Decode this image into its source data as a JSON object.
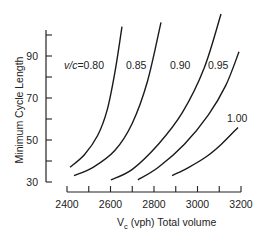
{
  "chart_data": {
    "type": "line",
    "title": "",
    "xlabel": "V_c (vph) Total volume",
    "xlabel_main": "V",
    "xlabel_sub": "c",
    "xlabel_rest": " (vph) Total  volume",
    "ylabel": "Minimum Cycle Length",
    "xlim": [
      2400,
      3200
    ],
    "ylim": [
      30,
      100
    ],
    "x_ticks": [
      2400,
      2500,
      2600,
      2700,
      2800,
      2900,
      3000,
      3100,
      3200
    ],
    "x_tick_labels": [
      "2400",
      "2600",
      "2800",
      "3000",
      "3200"
    ],
    "y_ticks": [
      30,
      40,
      50,
      60,
      70,
      80,
      90,
      100
    ],
    "y_tick_labels": [
      "30",
      "50",
      "70",
      "90"
    ],
    "grid": false,
    "legend": "inline labels",
    "series": [
      {
        "name": "v/c = 0.80",
        "label": "v/c = 0.80",
        "x": [
          2414,
          2480,
          2540,
          2584,
          2620,
          2653
        ],
        "y": [
          37,
          43,
          52,
          64,
          82,
          104
        ]
      },
      {
        "name": "0.85",
        "label": "0.85",
        "x": [
          2432,
          2520,
          2620,
          2700,
          2770,
          2832
        ],
        "y": [
          33,
          37,
          45,
          58,
          78,
          106
        ]
      },
      {
        "name": "0.90",
        "label": "0.90",
        "x": [
          2602,
          2700,
          2820,
          2930,
          3030,
          3108
        ],
        "y": [
          31,
          36,
          48,
          63,
          84,
          110
        ]
      },
      {
        "name": "0.95",
        "label": "0.95",
        "x": [
          2726,
          2820,
          2940,
          3050,
          3130,
          3191
        ],
        "y": [
          31,
          37,
          48,
          62,
          76,
          92
        ]
      },
      {
        "name": "1.00",
        "label": "1.00",
        "x": [
          2883,
          2960,
          3040,
          3110,
          3186
        ],
        "y": [
          33,
          37,
          42,
          48,
          56
        ]
      }
    ]
  }
}
